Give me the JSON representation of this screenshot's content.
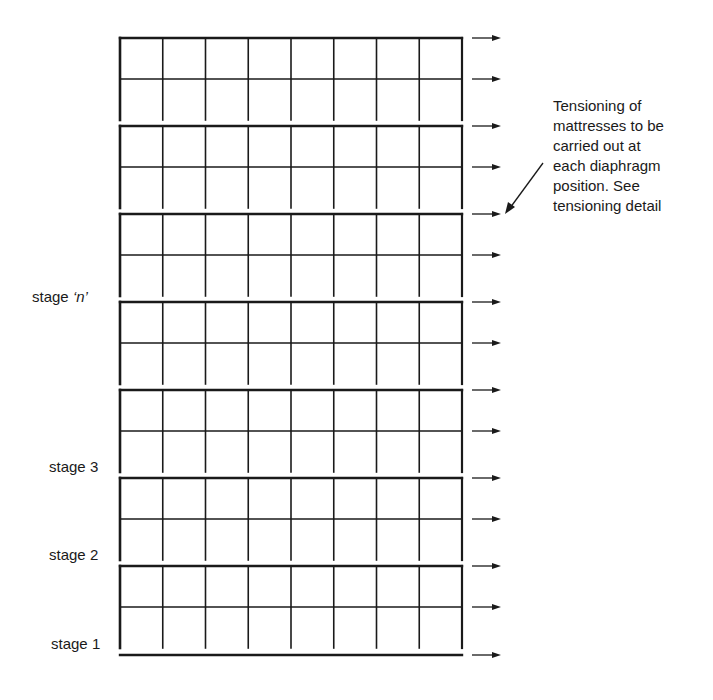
{
  "diagram": {
    "type": "staged construction sequence of wall panels (mattresses)",
    "columns": 8,
    "rows_per_stage": 2,
    "stage_count_drawn": 7,
    "stage_labels": [
      {
        "id": "n",
        "prefix": "stage ",
        "value": "‘n’"
      },
      {
        "id": "3",
        "prefix": "stage ",
        "value": "3"
      },
      {
        "id": "2",
        "prefix": "stage ",
        "value": "2"
      },
      {
        "id": "1",
        "prefix": "stage ",
        "value": "1"
      }
    ],
    "annotation": {
      "lines": [
        "Tensioning of",
        "mattresses to be",
        "carried out at",
        "each diaphragm",
        "position. See",
        "tensioning detail"
      ]
    },
    "colors": {
      "line": "#1a1a1a",
      "background": "#ffffff"
    }
  }
}
